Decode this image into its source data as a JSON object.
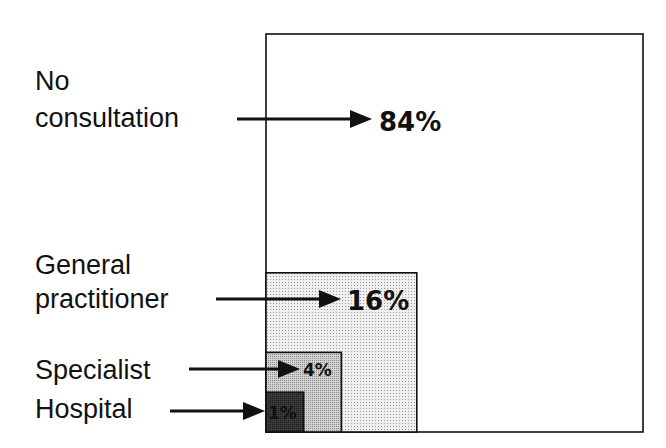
{
  "chart_data": {
    "type": "nested-area",
    "title": "",
    "categories": [
      "No consultation",
      "General practitioner",
      "Specialist",
      "Hospital"
    ],
    "values": [
      84,
      16,
      4,
      1
    ],
    "unit": "%",
    "series": [
      {
        "name": "No consultation",
        "label_lines": [
          "No",
          "consultation"
        ],
        "value": 84,
        "value_label": "84%",
        "fill": "#ffffff",
        "text_color": "#111111"
      },
      {
        "name": "General practitioner",
        "label_lines": [
          "General",
          "practitioner"
        ],
        "value": 16,
        "value_label": "16%",
        "fill": "#e4e4e4",
        "text_color": "#111111"
      },
      {
        "name": "Specialist",
        "label_lines": [
          "Specialist"
        ],
        "value": 4,
        "value_label": "4%",
        "fill": "#bdbdbd",
        "text_color": "#111111"
      },
      {
        "name": "Hospital",
        "label_lines": [
          "Hospital"
        ],
        "value": 1,
        "value_label": "1%",
        "fill": "#3a3a3a",
        "text_color": "#ffffff"
      }
    ],
    "total": 100,
    "xlabel": "",
    "ylabel": ""
  }
}
